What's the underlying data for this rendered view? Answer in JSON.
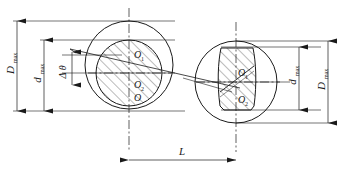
{
  "figure": {
    "type": "engineering-drawing",
    "background_color": "#ffffff",
    "line_color": "#1a1a1a",
    "centerline_color": "#1a1a1a"
  },
  "dimensions": {
    "outer_left": {
      "symbol": "D",
      "subscript": "max",
      "orientation": "vertical"
    },
    "inner_left": {
      "symbol": "d",
      "subscript": "max",
      "orientation": "vertical"
    },
    "inner_right": {
      "symbol": "d",
      "subscript": "max",
      "orientation": "vertical"
    },
    "outer_right": {
      "symbol": "D",
      "subscript": "max",
      "orientation": "vertical"
    },
    "angle": {
      "symbol": "Δ θ",
      "orientation": "vertical"
    },
    "length": {
      "symbol": "L",
      "orientation": "horizontal"
    }
  },
  "centers": {
    "left": [
      {
        "symbol": "O",
        "subscript": "1"
      },
      {
        "symbol": "O",
        "subscript": "2"
      },
      {
        "symbol": "O",
        "subscript": ""
      }
    ],
    "right": [
      {
        "symbol": "O",
        "subscript": "1"
      },
      {
        "symbol": "O",
        "subscript": "2"
      }
    ]
  },
  "geometry": {
    "left_outer_circle": {
      "cx": 129,
      "cy": 65,
      "r": 44
    },
    "left_inner_circle": {
      "cx": 129,
      "cy": 73,
      "r": 33
    },
    "right_outer_circle": {
      "cx": 236,
      "cy": 82,
      "r": 41
    },
    "left_axis_x": 129,
    "right_axis_x": 236,
    "hatch_angle_deg": 45
  }
}
